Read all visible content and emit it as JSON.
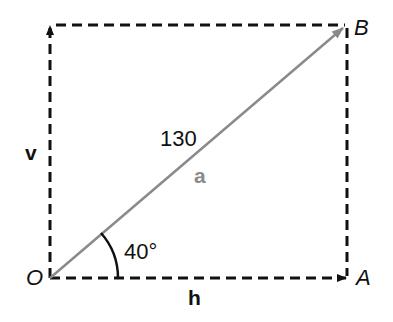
{
  "diagram": {
    "type": "vector-decomposition",
    "points": {
      "origin": "O",
      "end_horizontal": "A",
      "end_resultant": "B"
    },
    "vectors": {
      "resultant": {
        "label": "a",
        "magnitude": "130",
        "color": "#8a8a8a"
      },
      "horizontal": {
        "label": "h",
        "color": "#111111"
      },
      "vertical": {
        "label": "v",
        "color": "#111111"
      }
    },
    "angle": {
      "value": "40°"
    }
  }
}
